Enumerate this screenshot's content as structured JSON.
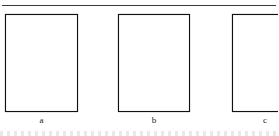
{
  "figure": {
    "type": "line-drawing-figure",
    "background_color": "#ffffff",
    "ink_color": "#111111",
    "fill_black": "#0a0a0a",
    "top_rule": {
      "present": true,
      "color": "#3a3a3a"
    },
    "panels": [
      {
        "id": "a",
        "caption": "a",
        "description": "Rectangular frame containing an hourglass of two hatched triangles plus a white notched step region on the right.",
        "regions": [
          {
            "name": "upper-hatched-triangle",
            "fill": "diagonal-hatch"
          },
          {
            "name": "lower-hatched-triangle",
            "fill": "diagonal-hatch"
          },
          {
            "name": "right-notch",
            "fill": "white"
          }
        ]
      },
      {
        "id": "b",
        "caption": "b",
        "description": "Same hourglass hatched pattern as panel a, with an additional solid black wedge in the upper-right corner and a white notched step region.",
        "regions": [
          {
            "name": "upper-hatched-triangle",
            "fill": "diagonal-hatch"
          },
          {
            "name": "lower-hatched-triangle",
            "fill": "diagonal-hatch"
          },
          {
            "name": "upper-right-black-wedge",
            "fill": "black"
          },
          {
            "name": "right-notch",
            "fill": "white"
          }
        ]
      },
      {
        "id": "c",
        "caption": "c",
        "description": "Frame divided into three horizontal bands; upper and lower bands hatched, central white band containing a solid black bowtie. Panel is clipped at the right image edge.",
        "clipped_at_right_edge": true,
        "regions": [
          {
            "name": "upper-band-hatched",
            "fill": "diagonal-hatch"
          },
          {
            "name": "middle-band-white",
            "fill": "white"
          },
          {
            "name": "middle-band-black-bowtie",
            "fill": "black"
          },
          {
            "name": "lower-band-hatched",
            "fill": "diagonal-hatch"
          }
        ]
      }
    ],
    "footer": {
      "partial_text_row": true
    }
  }
}
